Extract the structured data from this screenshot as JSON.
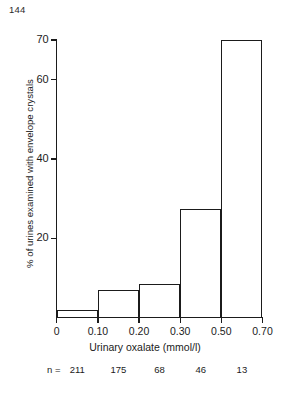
{
  "page_number": "144",
  "chart_data": {
    "type": "bar",
    "title": "",
    "xlabel": "Urinary oxalate (mmol/l)",
    "ylabel": "% of urines examined with envelope crystals",
    "categories": [
      "0-0.10",
      "0.10-0.20",
      "0.20-0.30",
      "0.30-0.50",
      "0.50-0.70"
    ],
    "values": [
      2,
      7,
      8.5,
      27.5,
      70
    ],
    "bin_edges": [
      "0",
      "0.10",
      "0.20",
      "0.30",
      "0.50",
      "0.70"
    ],
    "x_tick_labels": [
      "0",
      "0.10",
      "0.20",
      "0.30",
      "0.50",
      "0.70"
    ],
    "x_axis_scale": "categorical-evenly-spaced-bin-edges",
    "y_tick_labels": [
      "20",
      "40",
      "60",
      "70"
    ],
    "y_tick_values": [
      20,
      40,
      60,
      70
    ],
    "ylim": [
      0,
      72
    ],
    "grid": false,
    "legend": "none",
    "bar_style": "open-outline",
    "bar_color": "#ffffff",
    "bar_edge_color": "#1b1b1b",
    "sample_sizes": {
      "label": "n =",
      "values": [
        "211",
        "175",
        "68",
        "46",
        "13"
      ]
    }
  }
}
